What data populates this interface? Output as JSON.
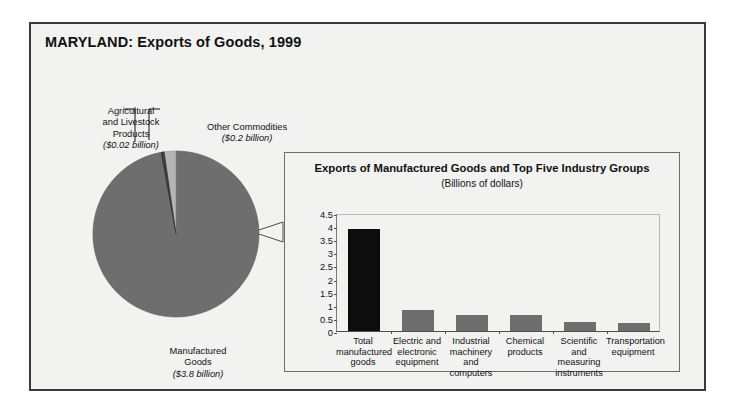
{
  "figure": {
    "title": "MARYLAND: Exports of Goods, 1999",
    "colors": {
      "panel_background": "#f2f2f1",
      "panel_border": "#3a3a3a",
      "pie_major_slice": "#6e6e6e",
      "pie_other_slice": "#b4b4b4",
      "pie_agricultural_slice": "#3d3d3d",
      "bar_total": "#0d0d0d",
      "bar_industry": "#6e6e6e",
      "text": "#111111"
    }
  },
  "pie": {
    "slices": [
      {
        "name": "Manufactured Goods",
        "label_line1": "Manufactured",
        "label_line2": "Goods",
        "amount_label": "($3.8 billion)",
        "value": 3.8,
        "units": "billions of dollars",
        "color": "#6e6e6e"
      },
      {
        "name": "Other Commodities",
        "label_line1": "Other Commodities",
        "label_line2": "",
        "amount_label": "($0.2 billion)",
        "value": 0.2,
        "units": "billions of dollars",
        "color": "#b4b4b4"
      },
      {
        "name": "Agricultural and Livestock Products",
        "label_line1": "Agricultural",
        "label_line2": "and Livestock",
        "label_line3": "Products",
        "amount_label": "($0.02 billion)",
        "value": 0.02,
        "units": "billions of dollars",
        "color": "#3d3d3d"
      }
    ]
  },
  "inset": {
    "title": "Exports of Manufactured Goods and Top Five Industry Groups",
    "subtitle": "(Billions of dollars)"
  },
  "chart_data": {
    "type": "bar",
    "title": "Exports of Manufactured Goods and Top Five Industry Groups",
    "subtitle": "(Billions of dollars)",
    "xlabel": "",
    "ylabel": "",
    "ylim": [
      0,
      4.5
    ],
    "yticks": [
      0,
      0.5,
      1,
      1.5,
      2,
      2.5,
      3,
      3.5,
      4,
      4.5
    ],
    "ytick_labels": [
      "0",
      "0.5",
      "1",
      "1.5",
      "2",
      "2.5",
      "3",
      "3.5",
      "4",
      "4.5"
    ],
    "grid": false,
    "legend": "none",
    "categories": [
      "Total manufactured goods",
      "Electric and electronic equipment",
      "Industrial machinery and computers",
      "Chemical products",
      "Scientific and measuring instruments",
      "Transportation equipment"
    ],
    "category_lines": [
      [
        "Total",
        "manufactured",
        "goods"
      ],
      [
        "Electric and",
        "electronic",
        "equipment"
      ],
      [
        "Industrial",
        "machinery and",
        "computers"
      ],
      [
        "Chemical",
        "products"
      ],
      [
        "Scientific and",
        "measuring",
        "instruments"
      ],
      [
        "Transportation",
        "equipment"
      ]
    ],
    "values": [
      3.9,
      0.82,
      0.6,
      0.62,
      0.35,
      0.3
    ],
    "bar_colors": [
      "#0d0d0d",
      "#6e6e6e",
      "#6e6e6e",
      "#6e6e6e",
      "#6e6e6e",
      "#6e6e6e"
    ]
  }
}
